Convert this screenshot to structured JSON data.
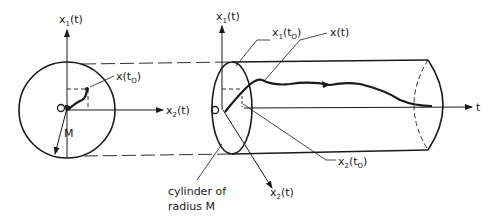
{
  "diagram": {
    "left_view": {
      "axis_vertical": {
        "base": "x",
        "sub": "1",
        "arg": "(t)"
      },
      "axis_horizontal": {
        "base": "x",
        "sub": "2",
        "arg": "(t)"
      },
      "origin": "O",
      "radius_label": "M",
      "point_label": {
        "base": "x",
        "arg_open": "(t",
        "sub": "O",
        "arg_close": ")"
      }
    },
    "right_view": {
      "axis_vertical": {
        "base": "x",
        "sub": "1",
        "arg": "(t)"
      },
      "axis_depth": {
        "base": "x",
        "sub": "2",
        "arg": "(t)"
      },
      "axis_time": "t",
      "origin": "O",
      "label_x1_t0": {
        "base": "x",
        "sub": "1",
        "arg_open": "(t",
        "sub2": "O",
        "arg_close": ")"
      },
      "label_xt": "x(t)",
      "label_x2_t0": {
        "base": "x",
        "sub": "2",
        "arg_open": "(t",
        "sub2": "O",
        "arg_close": ")"
      },
      "cylinder_caption_line1": "cylinder of",
      "cylinder_caption_line2": "radius M"
    }
  }
}
